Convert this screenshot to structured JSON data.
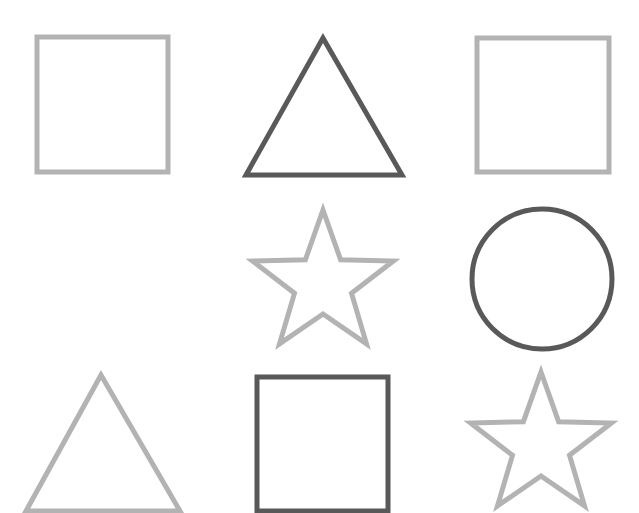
{
  "canvas": {
    "width": 639,
    "height": 513,
    "background": "#ffffff"
  },
  "colors": {
    "light": "#b3b3b3",
    "dark": "#595959"
  },
  "stroke_width": 5,
  "shapes": [
    {
      "id": "shape-1",
      "row": 1,
      "col": 1,
      "type": "square",
      "tone": "light",
      "x": 37,
      "y": 37,
      "w": 131,
      "h": 135
    },
    {
      "id": "shape-2",
      "row": 1,
      "col": 2,
      "type": "triangle",
      "tone": "dark",
      "points": "323,38 246,175 402,175"
    },
    {
      "id": "shape-3",
      "row": 1,
      "col": 3,
      "type": "square",
      "tone": "light",
      "x": 477,
      "y": 38,
      "w": 132,
      "h": 134
    },
    {
      "id": "shape-4",
      "row": 2,
      "col": 2,
      "type": "star",
      "tone": "light",
      "cx": 323,
      "cy": 284,
      "r_outer": 74,
      "r_inner": 30
    },
    {
      "id": "shape-5",
      "row": 2,
      "col": 3,
      "type": "circle",
      "tone": "dark",
      "cx": 542,
      "cy": 279,
      "r": 70
    },
    {
      "id": "shape-6",
      "row": 3,
      "col": 1,
      "type": "triangle",
      "tone": "light",
      "points": "101,375 26,511 180,511"
    },
    {
      "id": "shape-7",
      "row": 3,
      "col": 2,
      "type": "square",
      "tone": "dark",
      "x": 257,
      "y": 377,
      "w": 131,
      "h": 134
    },
    {
      "id": "shape-8",
      "row": 3,
      "col": 3,
      "type": "star",
      "tone": "light",
      "cx": 541,
      "cy": 446,
      "r_outer": 74,
      "r_inner": 30
    }
  ]
}
